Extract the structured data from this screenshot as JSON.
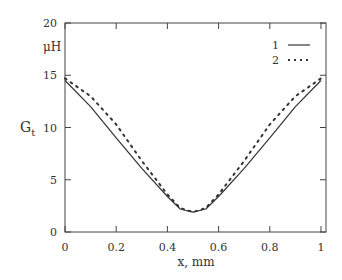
{
  "chart_data": {
    "type": "line",
    "title": "",
    "xlabel": "x, mm",
    "ylabel": "G_t",
    "yunit": "μH",
    "xlim": [
      0,
      1.02
    ],
    "ylim": [
      0,
      20
    ],
    "xticks": [
      "0",
      "0.2",
      "0.4",
      "0.6",
      "0.8",
      "1"
    ],
    "yticks": [
      "0",
      "5",
      "10",
      "15",
      "20"
    ],
    "grid": false,
    "legend_position": "upper right",
    "x": [
      0,
      0.1,
      0.2,
      0.3,
      0.4,
      0.45,
      0.5,
      0.55,
      0.6,
      0.7,
      0.8,
      0.9,
      1.0
    ],
    "series": [
      {
        "name": "1",
        "style": "solid",
        "values": [
          14.5,
          12.0,
          9.0,
          6.1,
          3.4,
          2.2,
          1.9,
          2.2,
          3.4,
          6.1,
          9.0,
          12.0,
          14.5
        ]
      },
      {
        "name": "2",
        "style": "dotted",
        "values": [
          14.7,
          13.0,
          10.3,
          6.8,
          3.6,
          2.3,
          1.9,
          2.3,
          3.6,
          6.8,
          10.3,
          13.0,
          14.7
        ]
      }
    ]
  },
  "labels": {
    "y_unit": "μH",
    "y_axis": "G",
    "y_axis_sub": "t",
    "x_axis": "x, mm",
    "legend_1": "1",
    "legend_2": "2"
  }
}
